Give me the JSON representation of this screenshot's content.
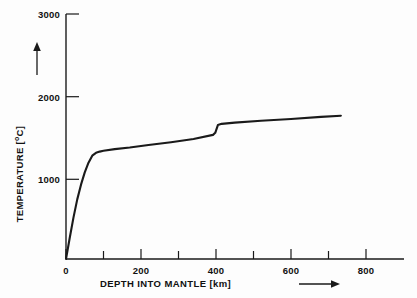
{
  "chart_data": {
    "type": "line",
    "title": "",
    "xlabel": "DEPTH INTO MANTLE [km]",
    "ylabel": "TEMPERATURE [°C]",
    "xlabel_prefix": "DEPTH INTO MANTLE [km]",
    "ylabel_prefix": "TEMPERATURE [",
    "ylabel_sup": "o",
    "ylabel_suffix": "C]",
    "xlim": [
      0,
      900
    ],
    "ylim": [
      0,
      3100
    ],
    "grid": false,
    "legend": null,
    "x_major_ticks": [
      0,
      200,
      400,
      600,
      800
    ],
    "x_minor_ticks": [
      100,
      300,
      500,
      700
    ],
    "x_tick_labels": [
      "0",
      "200",
      "400",
      "600",
      "800"
    ],
    "y_major_ticks": [
      1000,
      2000,
      3000
    ],
    "y_tick_labels": [
      "1000",
      "2000",
      "3000"
    ],
    "series": [
      {
        "name": "geotherm",
        "color": "#1a1a1a",
        "x": [
          0,
          10,
          20,
          30,
          40,
          50,
          60,
          70,
          80,
          90,
          100,
          130,
          170,
          220,
          280,
          340,
          392,
          398,
          405,
          415,
          450,
          520,
          600,
          680,
          733
        ],
        "y": [
          0,
          260,
          510,
          730,
          910,
          1060,
          1180,
          1265,
          1300,
          1315,
          1325,
          1345,
          1365,
          1395,
          1430,
          1470,
          1520,
          1545,
          1640,
          1655,
          1670,
          1692,
          1715,
          1740,
          1755
        ]
      }
    ],
    "annotations": {
      "x_axis_arrow": "arrow-right",
      "y_axis_arrow": "arrow-up"
    }
  },
  "axes": {
    "y_tick_0": "3000",
    "y_tick_1": "2000",
    "y_tick_2": "1000",
    "x_tick_0": "0",
    "x_tick_1": "200",
    "x_tick_2": "400",
    "x_tick_3": "600",
    "x_tick_4": "800"
  }
}
